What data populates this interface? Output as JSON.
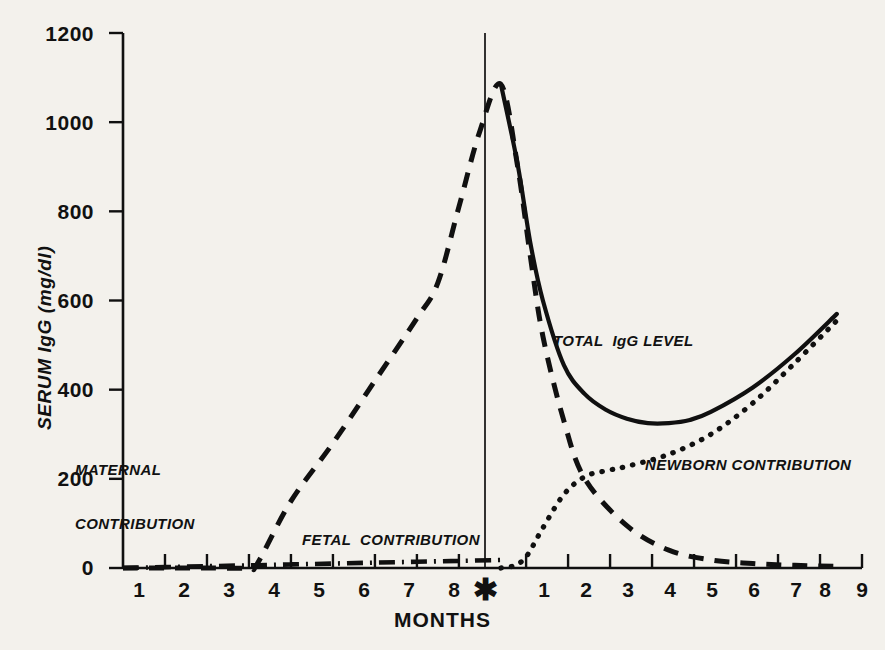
{
  "chart_data": {
    "type": "line",
    "title": "",
    "xlabel": "MONTHS",
    "ylabel": "SERUM IgG (mg/dl)",
    "ylim": [
      0,
      1200
    ],
    "yticks": [
      0,
      200,
      400,
      600,
      800,
      1000,
      1200
    ],
    "ytick_labels": [
      "0",
      "200",
      "400",
      "600",
      "800",
      "1000",
      "1200"
    ],
    "xtick_labels_prenatal": [
      "1",
      "2",
      "3",
      "4",
      "5",
      "6",
      "7",
      "8"
    ],
    "birth_marker": "✱",
    "xtick_labels_postnatal": [
      "1",
      "2",
      "3",
      "4",
      "5",
      "6",
      "7",
      "8",
      "9"
    ],
    "grid": false,
    "legend": "inline-annotations",
    "x_axis_note": "Months 1-8 before birth, asterisk marks birth, months 1-9 after birth",
    "series": [
      {
        "name": "MATERNAL CONTRIBUTION",
        "style": "dashed",
        "color": "#101010",
        "x": [
          0,
          1,
          2,
          3,
          3.2,
          4,
          5,
          6,
          7,
          7.5,
          8,
          8.5,
          9,
          9.4,
          9.7,
          10,
          10.5,
          11,
          12,
          13,
          14,
          15,
          16,
          17
        ],
        "y": [
          0,
          0,
          0,
          0,
          10,
          150,
          280,
          420,
          560,
          640,
          810,
          980,
          1085,
          900,
          700,
          520,
          330,
          200,
          95,
          40,
          18,
          10,
          6,
          4
        ]
      },
      {
        "name": "FETAL CONTRIBUTION",
        "style": "dash-dot",
        "color": "#101010",
        "x": [
          0,
          1,
          2,
          3,
          4,
          5,
          6,
          7,
          8,
          9
        ],
        "y": [
          0,
          2,
          4,
          6,
          8,
          10,
          12,
          14,
          16,
          18
        ]
      },
      {
        "name": "NEWBORN CONTRIBUTION",
        "style": "dotted",
        "color": "#101010",
        "x": [
          9,
          9.3,
          9.6,
          10,
          10.5,
          11,
          11.5,
          12,
          13,
          14,
          15,
          16,
          17
        ],
        "y": [
          0,
          5,
          25,
          90,
          165,
          205,
          218,
          228,
          255,
          300,
          370,
          460,
          555
        ]
      },
      {
        "name": "TOTAL IgG LEVEL",
        "style": "solid",
        "color": "#101010",
        "x": [
          9,
          9.4,
          9.7,
          10,
          10.5,
          11,
          11.5,
          12,
          12.5,
          13,
          13.5,
          14,
          15,
          16,
          17
        ],
        "y": [
          1085,
          905,
          730,
          600,
          455,
          390,
          355,
          335,
          325,
          325,
          332,
          350,
          405,
          480,
          570
        ]
      }
    ],
    "annotations": [
      {
        "name": "maternal-label",
        "text_lines": [
          "MATERNAL",
          "CONTRIBUTION"
        ]
      },
      {
        "name": "fetal-label",
        "text_lines": [
          "FETAL  CONTRIBUTION"
        ]
      },
      {
        "name": "total-label",
        "text_lines": [
          "TOTAL  IgG LEVEL"
        ]
      },
      {
        "name": "newborn-label",
        "text_lines": [
          "NEWBORN CONTRIBUTION"
        ]
      }
    ]
  },
  "axes": {
    "y_title": "SERUM IgG (mg/dl)",
    "x_title": "MONTHS",
    "y_labels": [
      "1200",
      "1000",
      "800",
      "600",
      "400",
      "200",
      "0"
    ],
    "x_labels_left": [
      "1",
      "2",
      "3",
      "4",
      "5",
      "6",
      "7",
      "8"
    ],
    "x_birth": "✱",
    "x_labels_right": [
      "1",
      "2",
      "3",
      "4",
      "5",
      "6",
      "7",
      "8",
      "9"
    ]
  },
  "annotations": {
    "maternal_line1": "MATERNAL",
    "maternal_line2": "CONTRIBUTION",
    "fetal": "FETAL  CONTRIBUTION",
    "total": "TOTAL  IgG LEVEL",
    "newborn": "NEWBORN CONTRIBUTION"
  },
  "colors": {
    "background": "#f3f1ec",
    "ink": "#101010"
  }
}
